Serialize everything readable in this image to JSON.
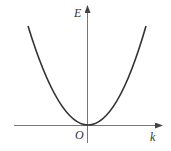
{
  "diagram": {
    "type": "function-plot",
    "axes": {
      "y_label": "E",
      "x_label": "k",
      "origin_label": "O"
    },
    "curve": {
      "shape": "parabola",
      "equation": "E ∝ k²",
      "vertex": "origin",
      "color": "#333333"
    },
    "axis_color": "#555555"
  }
}
